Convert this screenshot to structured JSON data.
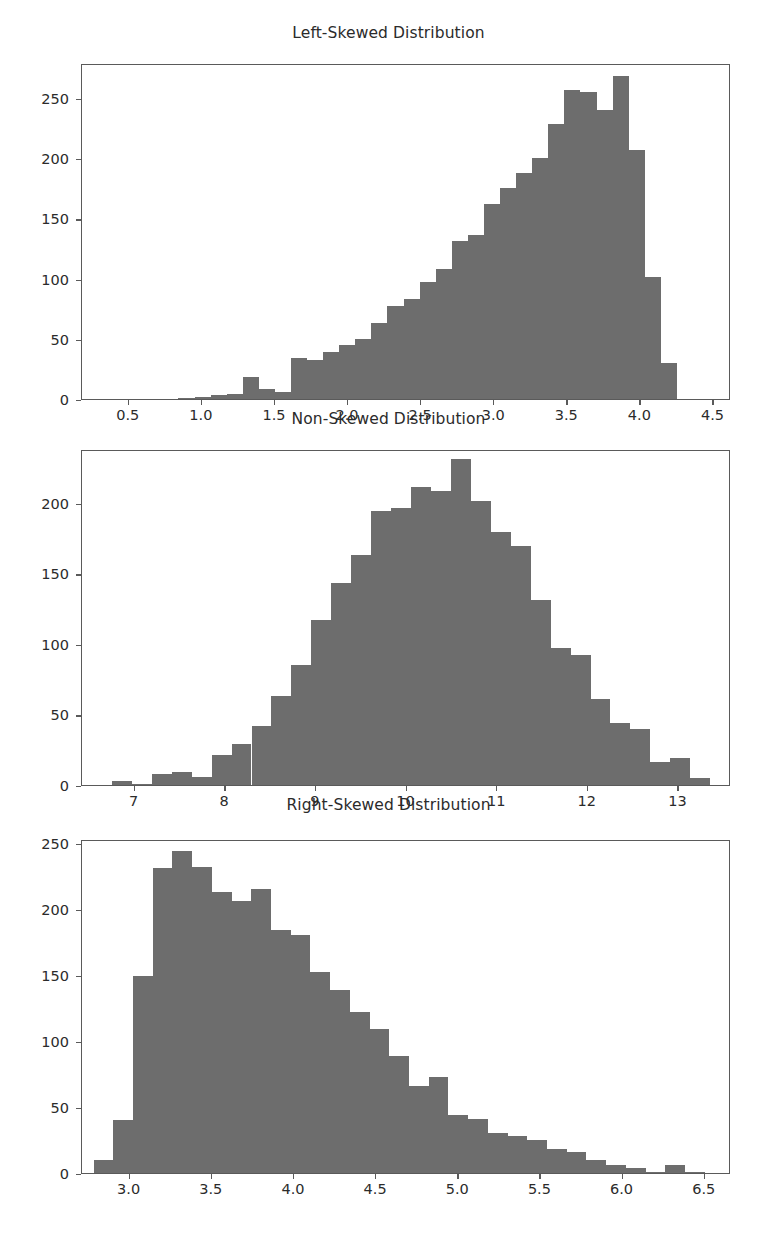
{
  "figure": {
    "background": "#ffffff",
    "bar_color": "#6d6d6d",
    "axis_color": "#5a5a5a",
    "text_color": "#2b2b2b",
    "width": 777,
    "height": 1257
  },
  "chart_data": [
    {
      "type": "bar",
      "title": "Left-Skewed Distribution",
      "xlabel": "",
      "ylabel": "",
      "grid": false,
      "legend": "none",
      "xlim": [
        0.18,
        4.62
      ],
      "ylim": [
        0,
        279
      ],
      "xticks": [
        0.5,
        1.0,
        1.5,
        2.0,
        2.5,
        3.0,
        3.5,
        4.0,
        4.5
      ],
      "xtick_labels": [
        "0.5",
        "1.0",
        "1.5",
        "2.0",
        "2.5",
        "3.0",
        "3.5",
        "4.0",
        "4.5"
      ],
      "yticks": [
        0,
        50,
        100,
        150,
        200,
        250
      ],
      "ytick_labels": [
        "0",
        "50",
        "100",
        "150",
        "200",
        "250"
      ],
      "bin_edges": [
        0.84,
        0.95,
        1.06,
        1.17,
        1.28,
        1.39,
        1.5,
        1.61,
        1.72,
        1.83,
        1.94,
        2.05,
        2.16,
        2.27,
        2.38,
        2.49,
        2.6,
        2.71,
        2.82,
        2.93,
        3.04,
        3.15,
        3.26,
        3.37,
        3.48,
        3.59,
        3.7,
        3.81,
        3.92,
        4.03,
        4.14,
        4.25
      ],
      "values": [
        1,
        2,
        3,
        4,
        18,
        8,
        6,
        34,
        32,
        39,
        45,
        50,
        63,
        77,
        83,
        97,
        108,
        131,
        136,
        162,
        175,
        188,
        200,
        228,
        257,
        255,
        240,
        268,
        207,
        101,
        30
      ]
    },
    {
      "type": "bar",
      "title": "Non-Skewed Distribution",
      "xlabel": "",
      "ylabel": "",
      "grid": false,
      "legend": "none",
      "xlim": [
        6.42,
        13.58
      ],
      "ylim": [
        0,
        238
      ],
      "xticks": [
        7,
        8,
        9,
        10,
        11,
        12,
        13
      ],
      "xtick_labels": [
        "7",
        "8",
        "9",
        "10",
        "11",
        "12",
        "13"
      ],
      "yticks": [
        0,
        50,
        100,
        150,
        200
      ],
      "ytick_labels": [
        "0",
        "50",
        "100",
        "150",
        "200"
      ],
      "bin_edges": [
        6.75,
        6.97,
        7.19,
        7.41,
        7.63,
        7.85,
        8.07,
        8.29,
        8.51,
        8.73,
        8.95,
        9.17,
        9.39,
        9.61,
        9.83,
        10.05,
        10.27,
        10.49,
        10.71,
        10.93,
        11.15,
        11.37,
        11.59,
        11.81,
        12.03,
        12.25,
        12.47,
        12.69,
        12.91,
        13.13,
        13.35
      ],
      "values": [
        3,
        1,
        8,
        9,
        6,
        21,
        29,
        42,
        63,
        85,
        117,
        143,
        163,
        194,
        196,
        211,
        208,
        231,
        201,
        179,
        169,
        131,
        97,
        92,
        61,
        44,
        40,
        16,
        19,
        5
      ],
      "note_values_after": [
        2
      ]
    },
    {
      "type": "bar",
      "title": "Right-Skewed Distribution",
      "xlabel": "",
      "ylabel": "",
      "grid": false,
      "legend": "none",
      "xlim": [
        2.71,
        6.66
      ],
      "ylim": [
        0,
        253
      ],
      "xticks": [
        3.0,
        3.5,
        4.0,
        4.5,
        5.0,
        5.5,
        6.0,
        6.5
      ],
      "xtick_labels": [
        "3.0",
        "3.5",
        "4.0",
        "4.5",
        "5.0",
        "5.5",
        "6.0",
        "6.5"
      ],
      "yticks": [
        0,
        50,
        100,
        150,
        200,
        250
      ],
      "ytick_labels": [
        "0",
        "50",
        "100",
        "150",
        "200",
        "250"
      ],
      "bin_edges": [
        2.78,
        2.9,
        3.02,
        3.14,
        3.26,
        3.38,
        3.5,
        3.62,
        3.74,
        3.86,
        3.98,
        4.1,
        4.22,
        4.34,
        4.46,
        4.58,
        4.7,
        4.82,
        4.94,
        5.06,
        5.18,
        5.3,
        5.42,
        5.54,
        5.66,
        5.78,
        5.9,
        6.02,
        6.14,
        6.26,
        6.38,
        6.5
      ],
      "values": [
        10,
        40,
        149,
        231,
        244,
        232,
        213,
        206,
        215,
        184,
        180,
        152,
        139,
        122,
        109,
        89,
        66,
        73,
        44,
        41,
        30,
        28,
        25,
        18,
        16,
        10,
        6,
        4,
        1,
        6,
        1
      ]
    }
  ]
}
